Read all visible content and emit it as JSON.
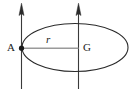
{
  "figure": {
    "type": "geometry-diagram",
    "caption_labels": {
      "point_a": "A",
      "point_g": "G",
      "radius": "r"
    },
    "colors": {
      "background": "#ffffff",
      "outline": "#2b2b2b",
      "radius_line": "#9a9a9a",
      "arrow": "#3a3a3a",
      "label_text": "#1a1a1a"
    },
    "geometry": {
      "canvas_width": 136,
      "canvas_height": 92,
      "ellipse": {
        "center_x": 75,
        "center_y": 47.5,
        "radius_x": 53,
        "radius_y": 24,
        "stroke_width": 1.1
      },
      "point_a": {
        "x": 21.5,
        "y": 48,
        "dot_radius": 2.6
      },
      "point_g": {
        "x": 78.5,
        "y": 48
      },
      "radius_segment": {
        "x1": 21.5,
        "y1": 48,
        "x2": 78.5,
        "y2": 48
      },
      "arrows": [
        {
          "name": "left-up-arrow",
          "x": 21.5,
          "y_bottom": 89,
          "y_tip": 4
        },
        {
          "name": "right-up-arrow",
          "x": 78.5,
          "y_bottom": 89,
          "y_tip": 4
        }
      ]
    }
  }
}
